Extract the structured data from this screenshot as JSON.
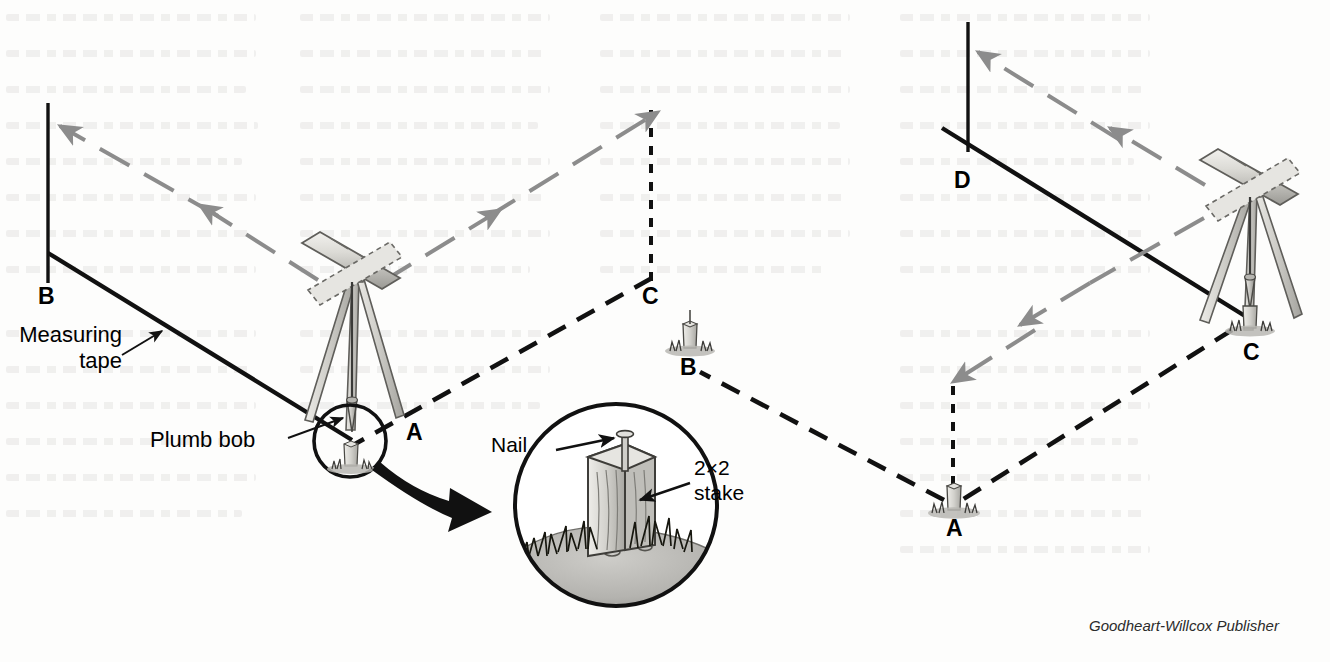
{
  "figure": {
    "type": "surveying-diagram",
    "credit": "Goodheart-Willcox Publisher",
    "background_color": "#ffffff",
    "ink_color": "#111111",
    "sightline_color": "#8c8c8c",
    "instrument_body_color": "#d9d8d4",
    "ground_color": "#b9b8b4"
  },
  "left_diagram": {
    "name": "setup-at-point-a",
    "points": [
      {
        "id": "B",
        "label": "B",
        "x": 48,
        "y": 296,
        "marker": "vertical-line"
      },
      {
        "id": "C",
        "label": "C",
        "x": 650,
        "y": 296,
        "marker": "dashed-vertical-line"
      },
      {
        "id": "A",
        "label": "A",
        "x": 415,
        "y": 432,
        "marker": "transit-station"
      }
    ],
    "annotations": [
      {
        "id": "measuring-tape",
        "line1": "Measuring",
        "line2": "tape"
      },
      {
        "id": "plumb-bob",
        "text": "Plumb bob"
      }
    ],
    "lines": [
      {
        "id": "tape-line-a-to-b",
        "style": "solid",
        "from": "A",
        "to": "B"
      },
      {
        "id": "line-a-to-c",
        "style": "dashed",
        "from": "A",
        "to": "C"
      }
    ],
    "sightlines": [
      {
        "id": "sight-a-to-b",
        "direction": "toward-B",
        "style": "dashed-arrow"
      },
      {
        "id": "sight-a-to-c",
        "direction": "toward-C",
        "style": "dashed-arrow"
      }
    ]
  },
  "right_diagram": {
    "name": "setup-at-point-c",
    "points": [
      {
        "id": "D",
        "label": "D",
        "x": 962,
        "y": 180,
        "marker": "vertical-line"
      },
      {
        "id": "B",
        "label": "B",
        "x": 688,
        "y": 365,
        "marker": "stake"
      },
      {
        "id": "C",
        "label": "C",
        "x": 1251,
        "y": 352,
        "marker": "transit-station"
      },
      {
        "id": "A",
        "label": "A",
        "x": 954,
        "y": 527,
        "marker": "stake"
      }
    ],
    "lines": [
      {
        "id": "tape-line-c-to-d",
        "style": "solid",
        "from": "C",
        "to": "D"
      },
      {
        "id": "line-c-to-a",
        "style": "dashed",
        "from": "C",
        "to": "A"
      },
      {
        "id": "line-a-to-b",
        "style": "dashed",
        "from": "A",
        "to": "B"
      },
      {
        "id": "dashed-vertical-at-a",
        "style": "dashed-vertical"
      }
    ],
    "sightlines": [
      {
        "id": "sight-c-to-d",
        "direction": "toward-D",
        "style": "dashed-arrow"
      },
      {
        "id": "sight-c-to-a",
        "direction": "toward-A",
        "style": "dashed-arrow"
      }
    ]
  },
  "inset": {
    "name": "stake-detail-magnifier",
    "source_point": "A",
    "labels": [
      {
        "id": "nail",
        "text": "Nail"
      },
      {
        "id": "stake",
        "line1": "2×2",
        "line2": "stake"
      }
    ],
    "contents": [
      "nail",
      "2×2 stake",
      "grass",
      "ground"
    ]
  }
}
